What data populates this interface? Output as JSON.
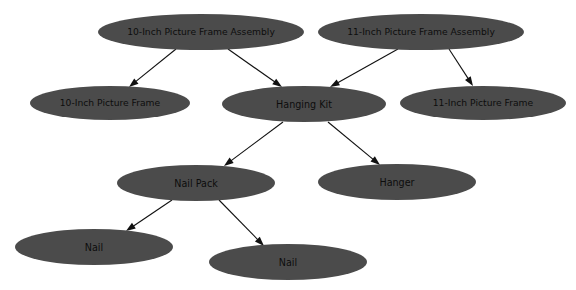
{
  "diagram": {
    "type": "directed-graph",
    "background_color": "#ffffff",
    "node_fill_color": "#4b4b4b",
    "node_text_color": "#0d0d0d",
    "edge_color": "#111111",
    "width": 576,
    "height": 290,
    "nodes": [
      {
        "id": "asm10",
        "label": "10-Inch Picture Frame Assembly",
        "cx": 201,
        "cy": 32,
        "rx": 103,
        "ry": 18,
        "font_size": 9.2
      },
      {
        "id": "asm11",
        "label": "11-Inch Picture Frame Assembly",
        "cx": 421,
        "cy": 32,
        "rx": 103,
        "ry": 18,
        "font_size": 9.2
      },
      {
        "id": "frame10",
        "label": "10-Inch Picture Frame",
        "cx": 110,
        "cy": 103,
        "rx": 80,
        "ry": 17,
        "font_size": 9.2
      },
      {
        "id": "hangingkit",
        "label": "Hanging Kit",
        "cx": 304,
        "cy": 104,
        "rx": 82,
        "ry": 18,
        "font_size": 9.6
      },
      {
        "id": "frame11",
        "label": "11-Inch Picture Frame",
        "cx": 483,
        "cy": 103,
        "rx": 83,
        "ry": 17,
        "font_size": 9.2
      },
      {
        "id": "nailpack",
        "label": "Nail Pack",
        "cx": 196,
        "cy": 183,
        "rx": 79,
        "ry": 18,
        "font_size": 9.6
      },
      {
        "id": "hanger",
        "label": "Hanger",
        "cx": 397,
        "cy": 182,
        "rx": 79,
        "ry": 18,
        "font_size": 9.6
      },
      {
        "id": "nail_left",
        "label": "Nail",
        "cx": 94,
        "cy": 247,
        "rx": 79,
        "ry": 18,
        "font_size": 9.6
      },
      {
        "id": "nail_right",
        "label": "Nail",
        "cx": 288,
        "cy": 262,
        "rx": 79,
        "ry": 18,
        "font_size": 9.6
      }
    ],
    "edges": [
      {
        "id": "e1",
        "from": "asm10",
        "to": "frame10",
        "x1": 176,
        "y1": 49,
        "x2": 129,
        "y2": 87
      },
      {
        "id": "e2",
        "from": "asm10",
        "to": "hangingkit",
        "x1": 228,
        "y1": 49,
        "x2": 282,
        "y2": 87
      },
      {
        "id": "e3",
        "from": "asm11",
        "to": "hangingkit",
        "x1": 398,
        "y1": 49,
        "x2": 330,
        "y2": 87
      },
      {
        "id": "e4",
        "from": "asm11",
        "to": "frame11",
        "x1": 449,
        "y1": 49,
        "x2": 473,
        "y2": 86
      },
      {
        "id": "e5",
        "from": "hangingkit",
        "to": "nailpack",
        "x1": 283,
        "y1": 122,
        "x2": 224,
        "y2": 166
      },
      {
        "id": "e6",
        "from": "hangingkit",
        "to": "hanger",
        "x1": 328,
        "y1": 122,
        "x2": 380,
        "y2": 165
      },
      {
        "id": "e7",
        "from": "nailpack",
        "to": "nail_left",
        "x1": 172,
        "y1": 200,
        "x2": 126,
        "y2": 231
      },
      {
        "id": "e8",
        "from": "nailpack",
        "to": "nail_right",
        "x1": 219,
        "y1": 200,
        "x2": 264,
        "y2": 246
      }
    ]
  }
}
